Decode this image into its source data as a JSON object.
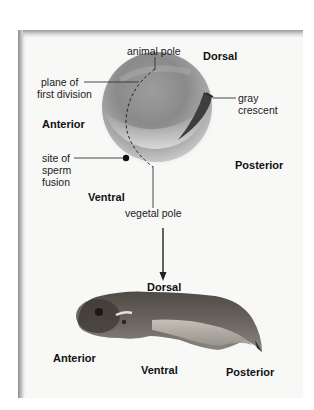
{
  "figure": {
    "top_panel": {
      "subject": "fertilized egg",
      "labels": {
        "animal_pole": "animal pole",
        "dorsal": "Dorsal",
        "plane_line1": "plane of",
        "plane_line2": "first division",
        "gray_line1": "gray",
        "gray_line2": "crescent",
        "anterior": "Anterior",
        "site_line1": "site of",
        "site_line2": "sperm",
        "site_line3": "fusion",
        "posterior": "Posterior",
        "ventral": "Ventral",
        "vegetal_pole": "vegetal pole"
      }
    },
    "bottom_panel": {
      "subject": "tadpole",
      "labels": {
        "dorsal": "Dorsal",
        "anterior": "Anterior",
        "ventral": "Ventral",
        "posterior": "Posterior"
      }
    },
    "colors": {
      "panel_bg": "#f8f8f7",
      "label_text": "#1a1a1a",
      "leader_line": "#333333",
      "sperm_dot": "#111111"
    }
  }
}
